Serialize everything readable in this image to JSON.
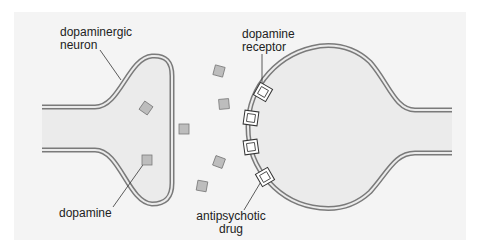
{
  "diagram": {
    "colors": {
      "panel_bg": "#f4f4f4",
      "cell_fill": "#ebebeb",
      "membrane": "#7a7a7a",
      "dopamine_fill": "#bdbdbd",
      "dopamine_stroke": "#7a7a7a",
      "receptor_fill": "#ffffff",
      "receptor_stroke": "#333333",
      "leader_line": "#333333",
      "text": "#222222"
    },
    "labels": {
      "neuron_line1": "dopaminergic",
      "neuron_line2": "neuron",
      "receptor_line1": "dopamine",
      "receptor_line2": "receptor",
      "dopamine": "dopamine",
      "drug_line1": "antipsychotic",
      "drug_line2": "drug"
    },
    "dopamine_molecules": [
      {
        "x": 146,
        "y": 108,
        "rot": 35
      },
      {
        "x": 147,
        "y": 160,
        "rot": 0
      },
      {
        "x": 184,
        "y": 129,
        "rot": 0
      },
      {
        "x": 219,
        "y": 71,
        "rot": 15
      },
      {
        "x": 224,
        "y": 104,
        "rot": -5
      },
      {
        "x": 219,
        "y": 162,
        "rot": 20
      },
      {
        "x": 202,
        "y": 186,
        "rot": 10
      }
    ],
    "receptors": [
      {
        "x": 263,
        "y": 92,
        "rot": 30
      },
      {
        "x": 251,
        "y": 118,
        "rot": 8
      },
      {
        "x": 251,
        "y": 147,
        "rot": -8
      },
      {
        "x": 265,
        "y": 177,
        "rot": -30
      }
    ]
  }
}
